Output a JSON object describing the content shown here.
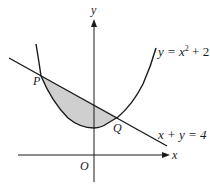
{
  "diagram": {
    "type": "graph",
    "axes": {
      "x_label": "x",
      "y_label": "y",
      "origin_label": "O"
    },
    "curves": [
      {
        "id": "parabola",
        "equation_text": "y = x",
        "equation_power": "2",
        "equation_tail": " + 2"
      },
      {
        "id": "line",
        "equation_text": "x + y = 4"
      }
    ],
    "points": [
      {
        "label": "P",
        "x": -2,
        "y": 6
      },
      {
        "label": "Q",
        "x": 1,
        "y": 3
      }
    ],
    "shaded_region": "between line and parabola from P to Q",
    "colors": {
      "stroke": "#1a1a1a",
      "shade": "#cfcfcf",
      "background": "#ffffff"
    }
  }
}
